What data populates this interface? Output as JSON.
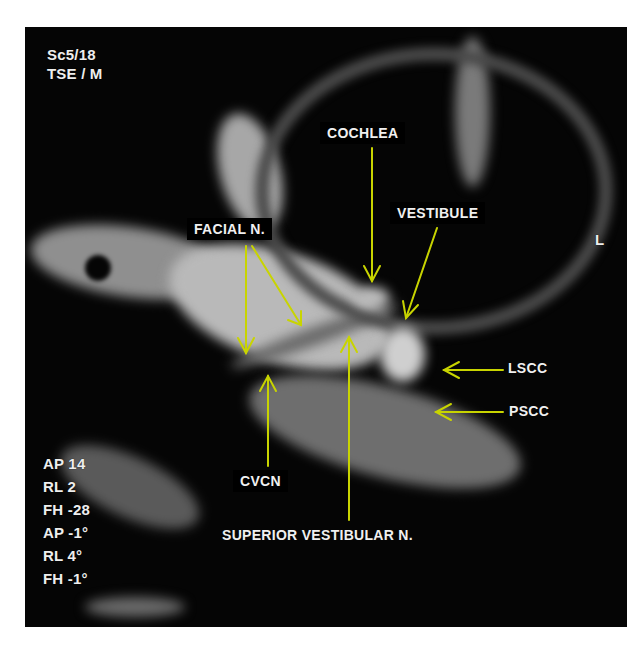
{
  "image": {
    "type": "MRI scan (axial, inner ear / internal auditory canal)",
    "background_color": "#ffffff",
    "arrow_color": "#c8d400"
  },
  "overlay": {
    "top_left": [
      "Sc5/18",
      "TSE / M"
    ],
    "orientation_marker": "L",
    "bottom_left": [
      "AP 14",
      "RL 2",
      "FH -28",
      "AP -1°",
      "RL 4°",
      "FH -1°"
    ]
  },
  "labels": {
    "cochlea": "COCHLEA",
    "vestibule": "VESTIBULE",
    "facial_n": "FACIAL N.",
    "lscc": "LSCC",
    "pscc": "PSCC",
    "cvcn": "CVCN",
    "superior_vestibular_n": "SUPERIOR VESTIBULAR N."
  }
}
